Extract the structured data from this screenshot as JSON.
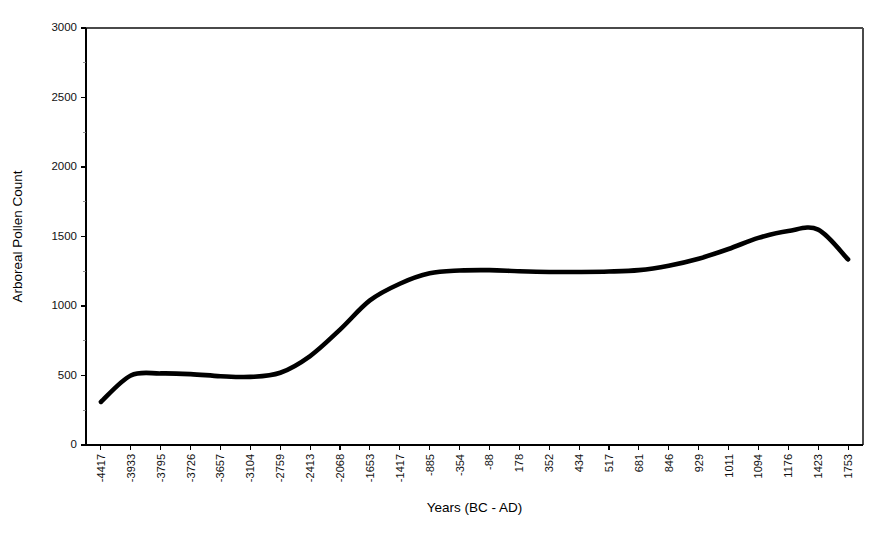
{
  "chart_data": {
    "type": "line",
    "title": "",
    "xlabel": "Years (BC - AD)",
    "ylabel": "Arboreal Pollen Count",
    "ylim": [
      0,
      3000
    ],
    "yticks": [
      0,
      500,
      1000,
      1500,
      2000,
      2500,
      3000
    ],
    "ytick_labels": [
      "0",
      "500",
      "1000",
      "1500",
      "2000",
      "2500",
      "3000"
    ],
    "grid": false,
    "legend": null,
    "categories": [
      "-4417",
      "-3933",
      "-3795",
      "-3726",
      "-3657",
      "-3104",
      "-2759",
      "-2413",
      "-2068",
      "-1653",
      "-1417",
      "-885",
      "-354",
      "-88",
      "178",
      "352",
      "434",
      "517",
      "681",
      "846",
      "929",
      "1011",
      "1094",
      "1176",
      "1423",
      "1753"
    ],
    "series": [
      {
        "name": "Arboreal Pollen Count",
        "color": "#000000",
        "values": [
          310,
          500,
          515,
          510,
          495,
          490,
          520,
          640,
          830,
          1040,
          1160,
          1235,
          1255,
          1258,
          1250,
          1245,
          1245,
          1248,
          1258,
          1290,
          1340,
          1410,
          1490,
          1540,
          1550,
          1335
        ]
      }
    ]
  },
  "plot_geometry": {
    "left": 86,
    "right": 863,
    "top": 28,
    "bottom": 445,
    "xlabel_y": 512,
    "ylabel_x": 22
  }
}
